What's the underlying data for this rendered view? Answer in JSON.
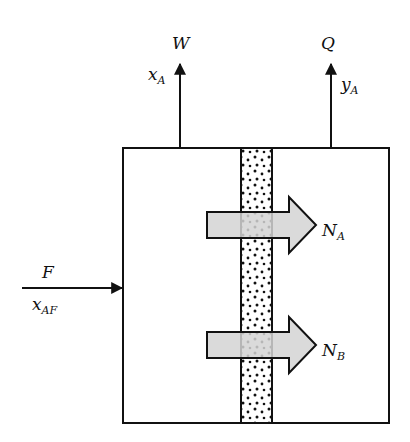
{
  "diagram": {
    "type": "membrane separator schematic",
    "colors": {
      "line": "#111111",
      "flux_arrow_fill": "#d4d4d4",
      "background": "#ffffff"
    },
    "streams": {
      "feed": {
        "name": "F",
        "composition_main": "x",
        "composition_sub": "AF"
      },
      "retentate": {
        "name": "W",
        "composition_main": "x",
        "composition_sub": "A"
      },
      "permeate": {
        "name": "Q",
        "composition_main": "y",
        "composition_sub": "A"
      }
    },
    "fluxes": [
      {
        "main": "N",
        "sub": "A"
      },
      {
        "main": "N",
        "sub": "B"
      }
    ],
    "membrane": {
      "fill": "stippled dots"
    }
  }
}
